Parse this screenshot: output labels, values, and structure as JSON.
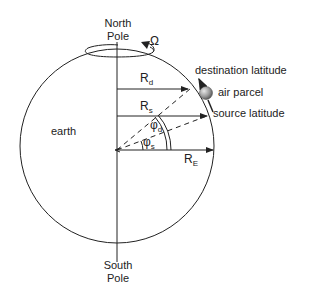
{
  "diagram": {
    "labels": {
      "north_pole_line1": "North",
      "north_pole_line2": "Pole",
      "south_pole_line1": "South",
      "south_pole_line2": "Pole",
      "earth": "earth",
      "omega": "Ω",
      "destination_latitude": "destination latitude",
      "air_parcel": "air parcel",
      "source_latitude": "source latitude",
      "r_d": {
        "main": "R",
        "sub": "d"
      },
      "r_s": {
        "main": "R",
        "sub": "s"
      },
      "r_e": {
        "main": "R",
        "sub": "E"
      },
      "phi_d": {
        "main": "φ",
        "sub": "d"
      },
      "phi_s": {
        "main": "φ",
        "sub": "s"
      }
    },
    "colors": {
      "line": "#222222",
      "parcel": "#9a9a9a"
    }
  }
}
